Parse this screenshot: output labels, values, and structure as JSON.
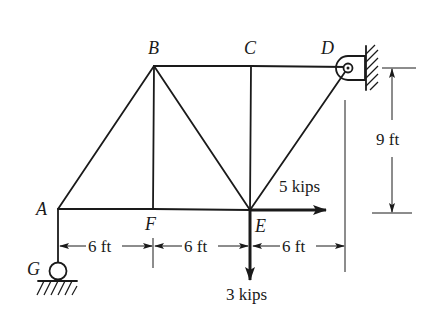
{
  "diagram": {
    "type": "truss",
    "nodes": {
      "A": {
        "label": "A"
      },
      "B": {
        "label": "B"
      },
      "C": {
        "label": "C"
      },
      "D": {
        "label": "D"
      },
      "E": {
        "label": "E"
      },
      "F": {
        "label": "F"
      },
      "G": {
        "label": "G"
      }
    },
    "members": [
      "AB",
      "BC",
      "CD",
      "AF",
      "FE",
      "BF",
      "BE",
      "CE",
      "DE",
      "AG"
    ],
    "supports": {
      "D": "pin support on vertical wall",
      "G": "roller on ground"
    },
    "loads": {
      "horizontal": {
        "node": "E",
        "label": "5 kips",
        "direction": "right"
      },
      "vertical": {
        "node": "E",
        "label": "3 kips",
        "direction": "down"
      }
    },
    "dimensions": {
      "span_1": "6 ft",
      "span_2": "6 ft",
      "span_3": "6 ft",
      "height": "9 ft"
    },
    "colors": {
      "ink": "#1a1a1a",
      "background": "#ffffff"
    }
  }
}
